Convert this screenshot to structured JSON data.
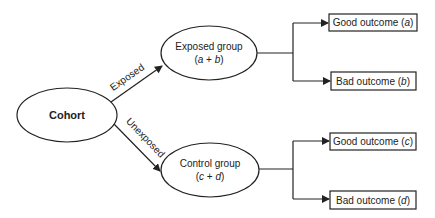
{
  "diagram": {
    "root": {
      "label": "Cohort"
    },
    "edges": [
      {
        "label": "Exposed",
        "from": "Cohort",
        "to": "Exposed group"
      },
      {
        "label": "Unexposed",
        "from": "Cohort",
        "to": "Control group"
      }
    ],
    "groups": [
      {
        "title": "Exposed group",
        "formula_open": "(",
        "formula_v1": "a",
        "formula_plus": " + ",
        "formula_v2": "b",
        "formula_close": ")",
        "outcomes": [
          {
            "text": "Good outcome (",
            "var": "a",
            "close": ")"
          },
          {
            "text": "Bad outcome (",
            "var": "b",
            "close": ")"
          }
        ]
      },
      {
        "title": "Control group",
        "formula_open": "(",
        "formula_v1": "c",
        "formula_plus": " + ",
        "formula_v2": "d",
        "formula_close": ")",
        "outcomes": [
          {
            "text": "Good outcome (",
            "var": "c",
            "close": ")"
          },
          {
            "text": "Bad outcome (",
            "var": "d",
            "close": ")"
          }
        ]
      }
    ],
    "colors": {
      "stroke": "#222222",
      "background": "#ffffff"
    }
  }
}
